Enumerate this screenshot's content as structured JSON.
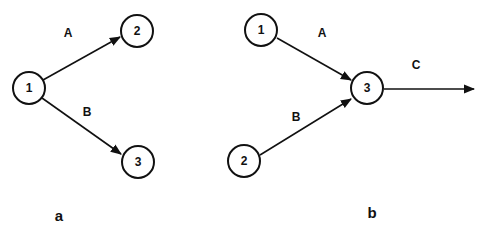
{
  "panels": [
    {
      "id": "a",
      "label": "a",
      "nodes": [
        {
          "id": "1",
          "label": "1"
        },
        {
          "id": "2",
          "label": "2"
        },
        {
          "id": "3",
          "label": "3"
        }
      ],
      "edges": [
        {
          "from": "1",
          "to": "2",
          "label": "A"
        },
        {
          "from": "1",
          "to": "3",
          "label": "B"
        }
      ]
    },
    {
      "id": "b",
      "label": "b",
      "nodes": [
        {
          "id": "1",
          "label": "1"
        },
        {
          "id": "2",
          "label": "2"
        },
        {
          "id": "3",
          "label": "3"
        }
      ],
      "edges": [
        {
          "from": "1",
          "to": "3",
          "label": "A"
        },
        {
          "from": "2",
          "to": "3",
          "label": "B"
        },
        {
          "from": "3",
          "to": "out",
          "label": "C"
        }
      ]
    }
  ],
  "colors": {
    "stroke": "#111111",
    "background": "#ffffff"
  }
}
